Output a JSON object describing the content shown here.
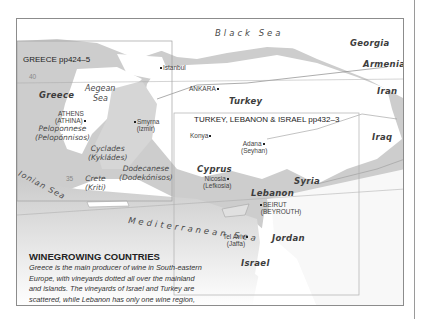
{
  "map": {
    "insets": {
      "greece": "GREECE pp424–5",
      "turkey": "TURKEY, LEBANON & ISRAEL pp432–3"
    },
    "countries": {
      "greece": "Greece",
      "turkey": "Turkey",
      "georgia": "Georgia",
      "armenia": "Armenia",
      "iran": "Iran",
      "iraq": "Iraq",
      "syria": "Syria",
      "lebanon": "Lebanon",
      "jordan": "Jordan",
      "israel": "Israel",
      "cyprus": "Cyprus"
    },
    "seas": {
      "black_sea": "Black Sea",
      "aegean_1": "Aegean",
      "aegean_2": "Sea",
      "ionian": "Ionian Sea",
      "mediterranean": "Mediterranean Sea"
    },
    "regions": {
      "peloponnese": "Peloponnese",
      "peloponnese_alt": "(Pelopónnisos)",
      "cyclades": "Cyclades",
      "cyclades_alt": "(Kykládes)",
      "dodecanese": "Dodecanese",
      "dodecanese_alt": "(Dodekónisos)",
      "crete": "Crete",
      "crete_alt": "(Kriti)"
    },
    "cities": {
      "istanbul": "Istanbul",
      "ankara": "ANKARA",
      "athens": "ATHENS",
      "athens_alt": "(ATHINA)",
      "smyrna": "Smyrna",
      "smyrna_alt": "(Izmir)",
      "konya": "Konya",
      "adana": "Adana",
      "adana_alt": "(Seyhan)",
      "nicosia": "Nicosia",
      "nicosia_alt": "(Lefkosia)",
      "beirut": "BEIRUT",
      "beirut_alt": "(BEYROUTH)",
      "tel_aviv": "Tel Aviv",
      "tel_aviv_alt": "(Jaffa)"
    },
    "grid_labels": {
      "lat_40": "40",
      "lat_35": "35"
    },
    "colors": {
      "sea": "#ffffff",
      "land_dark": "#c8c8c8",
      "land_mid": "#d9d9d9",
      "land_light": "#ffffff",
      "border": "#8c8c8c"
    }
  },
  "caption": {
    "title": "WINEGROWING COUNTRIES",
    "body": "Greece is the main producer of wine in South-eastern Europe, with vineyards dotted all over the mainland and islands. The vineyards of Israel and Turkey are scattered, while Lebanon has only one wine region, the Bekaa Valley. Wine styles vary considerably from country to country, although some of the terroir is similar."
  }
}
